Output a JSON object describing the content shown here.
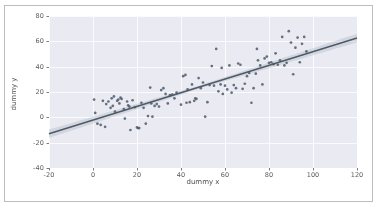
{
  "chart_data": {
    "type": "scatter",
    "title": "",
    "xlabel": "dummy x",
    "ylabel": "dummy y",
    "xlim": [
      -20,
      120
    ],
    "ylim": [
      -40,
      80
    ],
    "xticks": [
      -20,
      0,
      20,
      40,
      60,
      80,
      100,
      120
    ],
    "yticks": [
      -40,
      -20,
      0,
      20,
      40,
      60,
      80
    ],
    "grid": true,
    "legend": null,
    "style": {
      "plot_background": "#eaeaf2",
      "grid_color": "#ffffff",
      "point_color": "#4c5b69",
      "line_color": "#4c5b69",
      "band_color": "#b9bfc7",
      "frame_color": "#bdbdbd",
      "tick_color": "#5a5a5a"
    },
    "regression": {
      "type": "linear",
      "slope": 0.54,
      "intercept": -2.2,
      "ci_band": true,
      "endpoints": [
        [
          -20,
          -13.0
        ],
        [
          120,
          62.6
        ]
      ]
    },
    "points": [
      [
        0.5,
        14.0
      ],
      [
        1.0,
        3.5
      ],
      [
        2.0,
        -5.0
      ],
      [
        3.5,
        -6.0
      ],
      [
        4.5,
        13.0
      ],
      [
        5.5,
        -7.5
      ],
      [
        6.0,
        10.5
      ],
      [
        7.0,
        12.5
      ],
      [
        8.0,
        7.5
      ],
      [
        8.5,
        15.0
      ],
      [
        9.0,
        9.0
      ],
      [
        9.5,
        16.5
      ],
      [
        10.0,
        4.5
      ],
      [
        11.0,
        13.0
      ],
      [
        11.5,
        14.0
      ],
      [
        12.0,
        11.0
      ],
      [
        12.5,
        15.5
      ],
      [
        13.0,
        14.5
      ],
      [
        14.0,
        6.5
      ],
      [
        14.5,
        -1.0
      ],
      [
        15.5,
        12.5
      ],
      [
        16.0,
        9.5
      ],
      [
        16.5,
        8.5
      ],
      [
        17.0,
        -10.0
      ],
      [
        18.0,
        13.5
      ],
      [
        19.0,
        8.0
      ],
      [
        20.0,
        -8.0
      ],
      [
        20.5,
        -8.5
      ],
      [
        21.0,
        -8.5
      ],
      [
        22.0,
        11.5
      ],
      [
        23.0,
        7.5
      ],
      [
        24.0,
        -5.0
      ],
      [
        25.0,
        1.0
      ],
      [
        26.0,
        23.5
      ],
      [
        26.5,
        11.0
      ],
      [
        27.0,
        0.5
      ],
      [
        28.0,
        9.0
      ],
      [
        29.0,
        10.5
      ],
      [
        30.0,
        8.5
      ],
      [
        31.0,
        21.5
      ],
      [
        32.0,
        23.0
      ],
      [
        33.0,
        18.5
      ],
      [
        34.0,
        11.0
      ],
      [
        35.0,
        17.5
      ],
      [
        36.0,
        18.0
      ],
      [
        37.0,
        15.0
      ],
      [
        38.0,
        19.5
      ],
      [
        40.0,
        10.0
      ],
      [
        41.0,
        32.5
      ],
      [
        42.0,
        33.5
      ],
      [
        42.5,
        11.5
      ],
      [
        43.0,
        22.0
      ],
      [
        44.0,
        12.0
      ],
      [
        45.0,
        26.0
      ],
      [
        46.0,
        13.0
      ],
      [
        46.5,
        15.0
      ],
      [
        47.0,
        14.5
      ],
      [
        48.0,
        31.0
      ],
      [
        49.0,
        23.0
      ],
      [
        50.0,
        27.5
      ],
      [
        51.0,
        0.5
      ],
      [
        52.0,
        12.0
      ],
      [
        53.0,
        25.5
      ],
      [
        54.0,
        40.5
      ],
      [
        55.0,
        25.0
      ],
      [
        56.0,
        54.0
      ],
      [
        57.0,
        20.5
      ],
      [
        58.0,
        26.0
      ],
      [
        58.5,
        39.0
      ],
      [
        59.0,
        18.5
      ],
      [
        60.0,
        25.0
      ],
      [
        61.0,
        22.0
      ],
      [
        62.0,
        41.0
      ],
      [
        63.0,
        19.5
      ],
      [
        64.0,
        25.5
      ],
      [
        65.0,
        23.0
      ],
      [
        66.0,
        42.5
      ],
      [
        67.0,
        41.5
      ],
      [
        68.0,
        22.5
      ],
      [
        69.0,
        26.5
      ],
      [
        70.0,
        32.5
      ],
      [
        71.0,
        35.0
      ],
      [
        72.0,
        11.5
      ],
      [
        73.0,
        23.0
      ],
      [
        74.0,
        34.5
      ],
      [
        74.5,
        54.0
      ],
      [
        75.0,
        45.0
      ],
      [
        76.0,
        41.0
      ],
      [
        77.0,
        26.0
      ],
      [
        78.0,
        46.5
      ],
      [
        79.0,
        48.0
      ],
      [
        80.0,
        43.0
      ],
      [
        81.0,
        43.5
      ],
      [
        82.0,
        42.0
      ],
      [
        83.0,
        50.5
      ],
      [
        84.0,
        41.5
      ],
      [
        85.0,
        45.0
      ],
      [
        86.0,
        63.5
      ],
      [
        87.0,
        41.0
      ],
      [
        88.0,
        43.0
      ],
      [
        89.0,
        68.0
      ],
      [
        90.0,
        59.0
      ],
      [
        91.0,
        34.0
      ],
      [
        92.0,
        55.0
      ],
      [
        93.0,
        63.0
      ],
      [
        94.0,
        43.5
      ],
      [
        95.0,
        58.0
      ],
      [
        96.0,
        63.5
      ],
      [
        97.0,
        52.0
      ]
    ]
  }
}
